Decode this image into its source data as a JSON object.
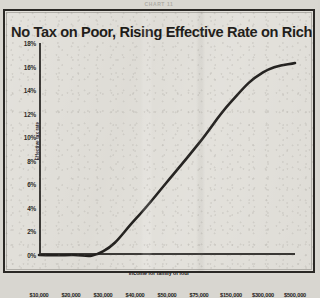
{
  "kicker": "CHART 11",
  "chart_data": {
    "type": "line",
    "title": "No Tax on Poor, Rising Effective Rate on Rich",
    "xlabel": "Income for family of four",
    "ylabel": "Effective tax rate",
    "categories": [
      "$10,000",
      "$20,000",
      "$30,000",
      "$40,000",
      "$50,000",
      "$75,000",
      "$150,000",
      "$300,000",
      "$500,000"
    ],
    "values": [
      0.0,
      0.0,
      0.3,
      3.0,
      6.2,
      9.5,
      13.0,
      15.5,
      16.3
    ],
    "ytick_labels": [
      "18%",
      "16%",
      "14%",
      "12%",
      "10%",
      "8%",
      "6%",
      "4%",
      "2%",
      "0%"
    ],
    "ytick_values": [
      18,
      16,
      14,
      12,
      10,
      8,
      6,
      4,
      2,
      0
    ],
    "ylim": [
      0,
      18
    ],
    "grid": false,
    "legend": "none",
    "series_color": "#1a1816"
  }
}
